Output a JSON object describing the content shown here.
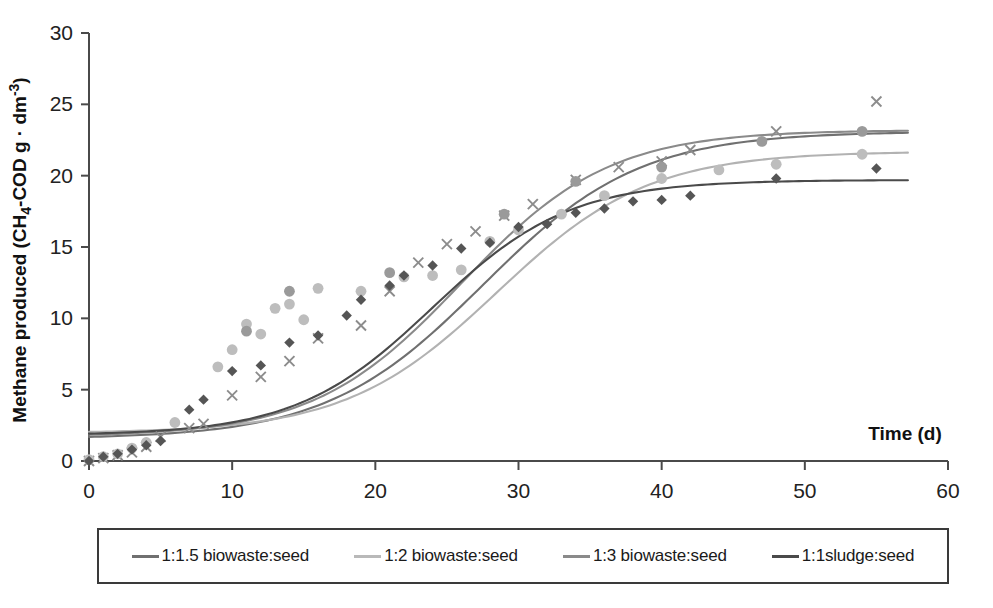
{
  "chart_data": {
    "type": "line",
    "title": "",
    "xlabel": "Time (d)",
    "ylabel": "Methane produced (CH4-COD g · dm-3)",
    "ylabel_parts": {
      "prefix": "Methane produced (CH",
      "sub1": "4",
      "mid": "-COD g · dm",
      "sup1": "-3",
      "suffix": ")"
    },
    "xlim": [
      0,
      60
    ],
    "ylim": [
      0,
      30
    ],
    "xticks": [
      0,
      10,
      20,
      30,
      40,
      50,
      60
    ],
    "yticks": [
      0,
      5,
      10,
      15,
      20,
      25,
      30
    ],
    "grid": false,
    "legend_position": "below-plot",
    "series": [
      {
        "name": "1:1.5 biowaste:seed",
        "color": "#707070",
        "marker": "x",
        "fit": {
          "model": "gompertz",
          "asymptote": 23.1,
          "midpoint": 27.5,
          "rate": 0.118,
          "offset": 1.55
        },
        "points": [
          {
            "x": 0,
            "y": 0.0
          },
          {
            "x": 1,
            "y": 0.2
          },
          {
            "x": 2,
            "y": 0.4
          },
          {
            "x": 3,
            "y": 0.6
          },
          {
            "x": 4,
            "y": 1.0
          },
          {
            "x": 5,
            "y": 1.7
          },
          {
            "x": 7,
            "y": 2.3
          },
          {
            "x": 8,
            "y": 2.6
          },
          {
            "x": 10,
            "y": 4.6
          },
          {
            "x": 12,
            "y": 5.9
          },
          {
            "x": 14,
            "y": 7.0
          },
          {
            "x": 16,
            "y": 8.6
          },
          {
            "x": 19,
            "y": 9.5
          },
          {
            "x": 21,
            "y": 11.9
          },
          {
            "x": 23,
            "y": 13.9
          },
          {
            "x": 25,
            "y": 15.2
          },
          {
            "x": 27,
            "y": 16.1
          },
          {
            "x": 29,
            "y": 17.2
          },
          {
            "x": 31,
            "y": 18.0
          },
          {
            "x": 34,
            "y": 19.7
          },
          {
            "x": 37,
            "y": 20.6
          },
          {
            "x": 40,
            "y": 21.0
          },
          {
            "x": 42,
            "y": 21.8
          },
          {
            "x": 48,
            "y": 23.1
          },
          {
            "x": 55,
            "y": 25.2
          }
        ]
      },
      {
        "name": "1:2 biowaste:seed",
        "color": "#b2b2b2",
        "marker": "circle",
        "fit": {
          "model": "gompertz",
          "asymptote": 21.7,
          "midpoint": 28.5,
          "rate": 0.122,
          "offset": 1.95
        },
        "points": [
          {
            "x": 0,
            "y": 0.1
          },
          {
            "x": 1,
            "y": 0.3
          },
          {
            "x": 2,
            "y": 0.5
          },
          {
            "x": 3,
            "y": 0.9
          },
          {
            "x": 4,
            "y": 1.3
          },
          {
            "x": 6,
            "y": 2.7
          },
          {
            "x": 9,
            "y": 6.6
          },
          {
            "x": 10,
            "y": 7.8
          },
          {
            "x": 11,
            "y": 9.6
          },
          {
            "x": 12,
            "y": 8.9
          },
          {
            "x": 13,
            "y": 10.7
          },
          {
            "x": 14,
            "y": 11.0
          },
          {
            "x": 15,
            "y": 9.9
          },
          {
            "x": 16,
            "y": 12.1
          },
          {
            "x": 19,
            "y": 11.9
          },
          {
            "x": 22,
            "y": 12.9
          },
          {
            "x": 24,
            "y": 13.0
          },
          {
            "x": 26,
            "y": 13.4
          },
          {
            "x": 28,
            "y": 15.4
          },
          {
            "x": 30,
            "y": 16.2
          },
          {
            "x": 33,
            "y": 17.3
          },
          {
            "x": 36,
            "y": 18.6
          },
          {
            "x": 40,
            "y": 19.8
          },
          {
            "x": 44,
            "y": 20.4
          },
          {
            "x": 48,
            "y": 20.8
          },
          {
            "x": 54,
            "y": 21.5
          }
        ]
      },
      {
        "name": "1:3 biowaste:seed",
        "color": "#8a8a8a",
        "marker": "circle-dark",
        "fit": {
          "model": "gompertz",
          "asymptote": 23.2,
          "midpoint": 26.0,
          "rate": 0.125,
          "offset": 1.7
        },
        "points": [
          {
            "x": 11,
            "y": 9.1
          },
          {
            "x": 14,
            "y": 11.9
          },
          {
            "x": 21,
            "y": 13.2
          },
          {
            "x": 29,
            "y": 17.3
          },
          {
            "x": 34,
            "y": 19.6
          },
          {
            "x": 40,
            "y": 20.6
          },
          {
            "x": 47,
            "y": 22.4
          },
          {
            "x": 54,
            "y": 23.1
          }
        ]
      },
      {
        "name": "1:1sludge:seed",
        "color": "#4a4a4a",
        "marker": "diamond",
        "fit": {
          "model": "gompertz",
          "asymptote": 19.7,
          "midpoint": 24.0,
          "rate": 0.135,
          "offset": 1.8
        },
        "points": [
          {
            "x": 0,
            "y": 0.0
          },
          {
            "x": 1,
            "y": 0.3
          },
          {
            "x": 2,
            "y": 0.5
          },
          {
            "x": 3,
            "y": 0.8
          },
          {
            "x": 4,
            "y": 1.1
          },
          {
            "x": 5,
            "y": 1.4
          },
          {
            "x": 7,
            "y": 3.6
          },
          {
            "x": 8,
            "y": 4.3
          },
          {
            "x": 10,
            "y": 6.3
          },
          {
            "x": 12,
            "y": 6.7
          },
          {
            "x": 14,
            "y": 8.3
          },
          {
            "x": 16,
            "y": 8.8
          },
          {
            "x": 18,
            "y": 10.2
          },
          {
            "x": 19,
            "y": 11.3
          },
          {
            "x": 21,
            "y": 12.3
          },
          {
            "x": 22,
            "y": 13.0
          },
          {
            "x": 24,
            "y": 13.7
          },
          {
            "x": 26,
            "y": 14.9
          },
          {
            "x": 28,
            "y": 15.3
          },
          {
            "x": 30,
            "y": 16.4
          },
          {
            "x": 32,
            "y": 16.6
          },
          {
            "x": 34,
            "y": 17.4
          },
          {
            "x": 36,
            "y": 17.7
          },
          {
            "x": 38,
            "y": 18.2
          },
          {
            "x": 40,
            "y": 18.3
          },
          {
            "x": 42,
            "y": 18.6
          },
          {
            "x": 48,
            "y": 19.8
          },
          {
            "x": 55,
            "y": 20.5
          }
        ]
      }
    ]
  },
  "legend": {
    "entries": [
      {
        "label": "1:1.5 biowaste:seed",
        "color": "#707070"
      },
      {
        "label": "1:2 biowaste:seed",
        "color": "#b9b9b9"
      },
      {
        "label": "1:3 biowaste:seed",
        "color": "#8a8a8a"
      },
      {
        "label": "1:1sludge:seed",
        "color": "#4a4a4a"
      }
    ]
  }
}
